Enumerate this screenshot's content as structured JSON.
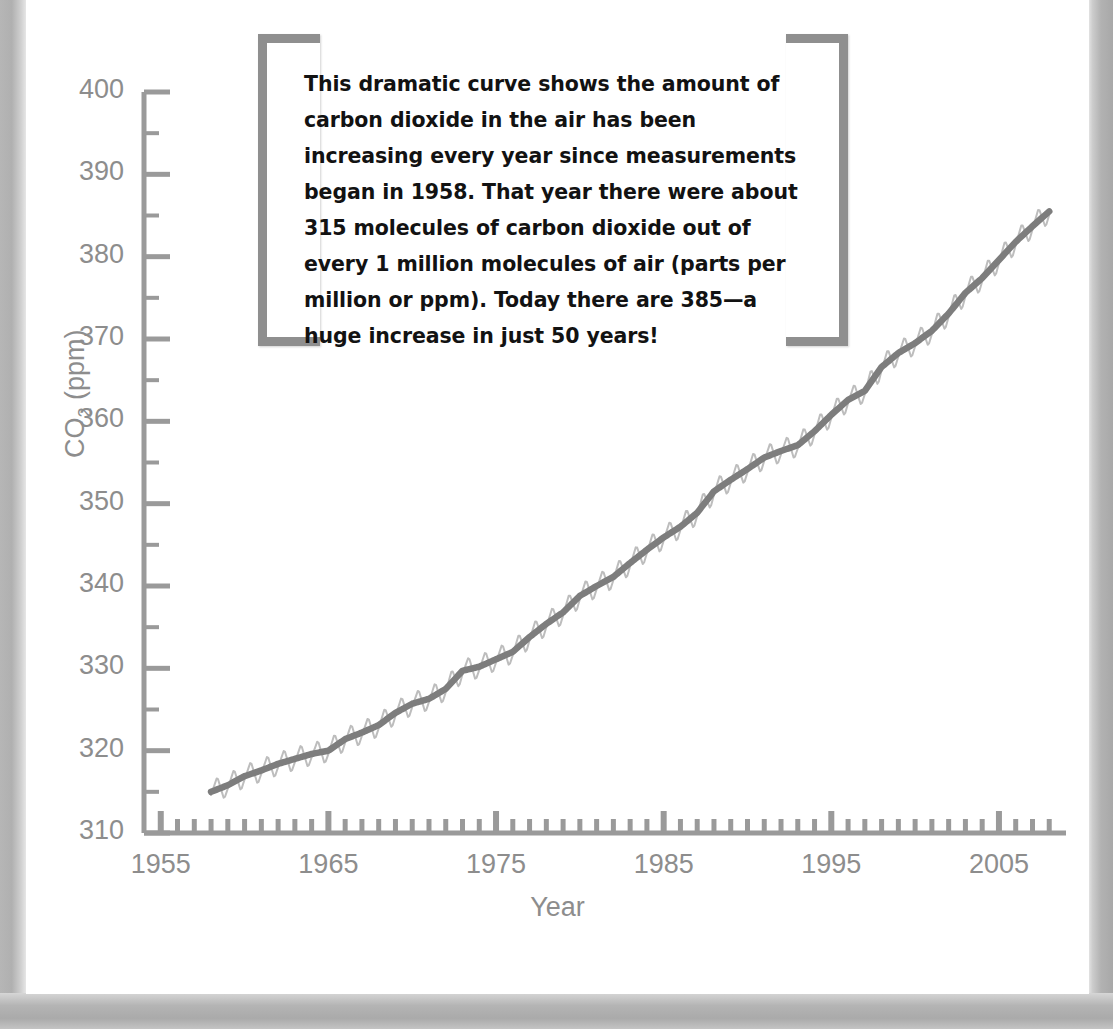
{
  "page": {
    "heading_partial": "fossil fuels.",
    "background": "#ffffff",
    "frame_color": "#b2b2b2"
  },
  "callout": {
    "text": "This dramatic curve shows the amount of carbon dioxide in the air has been increasing every year since measurements began in 1958. That year there were about 315 molecules of carbon dioxide out of every 1 million molecules of air (parts per million or ppm). Today there are 385—a huge increase in just 50 years!",
    "bracket_color": "#8f8f8f"
  },
  "chart_data": {
    "type": "line",
    "title": "",
    "xlabel": "Year",
    "ylabel": "CO2 (ppm)",
    "ylabel_display": "CO₂ (ppm)",
    "xlim": [
      1954,
      2009
    ],
    "ylim": [
      310,
      400
    ],
    "ytick_step": 10,
    "yminor_step": 5,
    "xtick_step": 10,
    "xminor_step": 1,
    "grid": false,
    "legend": "none",
    "axis_color": "#9a9a9a",
    "tick_label_color": "#8d8d8d",
    "yticks": [
      310,
      320,
      330,
      340,
      350,
      360,
      370,
      380,
      390,
      400
    ],
    "xticks": [
      1955,
      1965,
      1975,
      1985,
      1995,
      2005
    ],
    "series": [
      {
        "name": "Monthly mean CO2 (seasonal cycle)",
        "color": "#bdbdbd",
        "width": 2.0,
        "note": "sawtooth oscillation about the trend, amplitude about 3 ppm peak-to-trough, peak in May, trough in October",
        "amplitude_ppm": 3.1
      },
      {
        "name": "Annual mean CO2 trend",
        "color": "#7d7d7d",
        "width": 6.5,
        "x": [
          1958,
          1959,
          1960,
          1961,
          1962,
          1963,
          1964,
          1965,
          1966,
          1967,
          1968,
          1969,
          1970,
          1971,
          1972,
          1973,
          1974,
          1975,
          1976,
          1977,
          1978,
          1979,
          1980,
          1981,
          1982,
          1983,
          1984,
          1985,
          1986,
          1987,
          1988,
          1989,
          1990,
          1991,
          1992,
          1993,
          1994,
          1995,
          1996,
          1997,
          1998,
          1999,
          2000,
          2001,
          2002,
          2003,
          2004,
          2005,
          2006,
          2007,
          2008
        ],
        "values": [
          315.0,
          315.8,
          316.9,
          317.6,
          318.4,
          319.0,
          319.6,
          320.0,
          321.4,
          322.2,
          323.1,
          324.6,
          325.7,
          326.3,
          327.5,
          329.7,
          330.2,
          331.1,
          332.0,
          333.8,
          335.4,
          336.8,
          338.8,
          340.0,
          341.1,
          342.8,
          344.4,
          345.9,
          347.2,
          348.9,
          351.5,
          352.9,
          354.2,
          355.6,
          356.4,
          357.1,
          358.8,
          360.8,
          362.6,
          363.7,
          366.6,
          368.3,
          369.5,
          371.0,
          373.1,
          375.6,
          377.4,
          379.6,
          381.8,
          383.7,
          385.5
        ]
      }
    ],
    "annotations": {
      "start_year": 1958,
      "start_value": 315,
      "end_value": 385,
      "span_years": 50
    }
  },
  "axis_labels": {
    "y": [
      "400",
      "390",
      "380",
      "370",
      "360",
      "350",
      "340",
      "330",
      "320",
      "310"
    ],
    "x": [
      "1955",
      "1965",
      "1975",
      "1985",
      "1995",
      "2005"
    ]
  }
}
